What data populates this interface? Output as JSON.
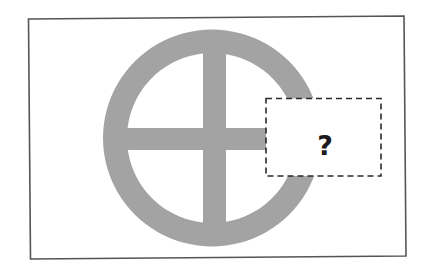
{
  "figure": {
    "question_box": {
      "label": "?",
      "border_style": "dashed"
    },
    "colors": {
      "frame": "#555555",
      "symbol_fill": "#a3a3a3",
      "dashed_border": "#2a2a2a",
      "question_mark": "#1c1c1c",
      "background": "#ffffff"
    },
    "symbol": {
      "shape": "circle-with-cross",
      "parts": [
        "outer-ring",
        "vertical-bar",
        "horizontal-bar"
      ],
      "occluded_region": "right"
    }
  }
}
